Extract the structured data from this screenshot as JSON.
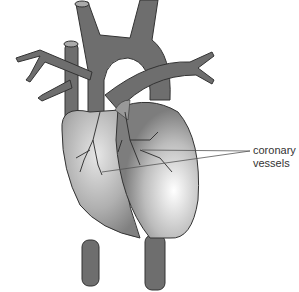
{
  "diagram": {
    "labels": {
      "line1": "coronary",
      "line2": "vessels"
    },
    "colors": {
      "vessel": "#6e6e6e",
      "vessel_outline": "#333333",
      "heart_light": "#f4f4f4",
      "heart_dark": "#8a8a8a",
      "coronary": "#2a2a2a",
      "leader_line": "#555555"
    }
  }
}
